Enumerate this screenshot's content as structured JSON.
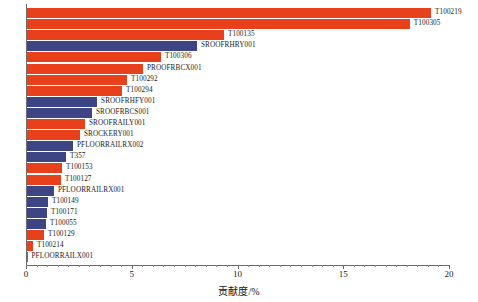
{
  "chart_data": {
    "type": "bar",
    "orientation": "horizontal",
    "title": "",
    "xlabel": "贡献度/%",
    "ylabel": "",
    "xlim": [
      0,
      21.3
    ],
    "xticks": [
      0,
      5,
      10,
      15,
      20
    ],
    "xtick_labels": [
      "0",
      "5",
      "10",
      "15",
      "20"
    ],
    "grid": false,
    "legend": null,
    "colors": {
      "red": "#e8401a",
      "blue": "#3e4584",
      "axis": "#6b6b6b",
      "text": "#1a1a1a",
      "background": "#ffffff"
    },
    "categories": [
      "T100219",
      "T100305",
      "T100135",
      "SROOFRHRY001",
      "T100306",
      "PROOFRBCX001",
      "T100292",
      "T100294",
      "SROOFRHFY001",
      "SROOFRBCS001",
      "SROOFRAILY001",
      "SROCKERY001",
      "PFLOORRAILRX002",
      "T357",
      "T100153",
      "T100127",
      "PFLOORRAILRX001",
      "T100149",
      "T100171",
      "T100055",
      "T100129",
      "T100214",
      "PFLOORRAILX001"
    ],
    "values": [
      19.15,
      18.15,
      9.36,
      8.08,
      6.38,
      5.53,
      4.78,
      4.54,
      3.36,
      3.12,
      2.79,
      2.55,
      2.22,
      1.89,
      1.7,
      1.65,
      1.32,
      1.04,
      0.99,
      0.95,
      0.85,
      0.33,
      0.05
    ],
    "bar_colors": [
      "red",
      "red",
      "red",
      "blue",
      "red",
      "red",
      "red",
      "red",
      "blue",
      "blue",
      "red",
      "red",
      "blue",
      "blue",
      "red",
      "red",
      "blue",
      "blue",
      "blue",
      "blue",
      "red",
      "red",
      "red"
    ]
  },
  "axis": {
    "title": "贡献度/%"
  }
}
